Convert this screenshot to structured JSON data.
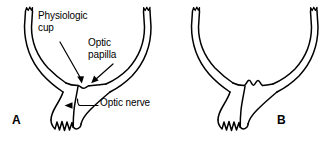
{
  "figure": {
    "background_color": "#ffffff",
    "stroke_color": "#000000",
    "width": 334,
    "height": 141
  },
  "labels": {
    "physiologic_cup": "Physiologic\ncup",
    "optic_papilla": "Optic\npapilla",
    "optic_nerve": "Optic nerve"
  },
  "panels": [
    {
      "letter": "A",
      "name": "normal-optic-disc",
      "description": "Normal eye wall with shallow physiologic cup"
    },
    {
      "letter": "B",
      "name": "excavated-optic-disc",
      "description": "Eye wall with deepened cup excavation"
    }
  ],
  "annotations": [
    {
      "name": "physiologic-cup-arrow",
      "points_to": "physiologic cup"
    },
    {
      "name": "optic-papilla-arrow",
      "points_to": "optic papilla"
    },
    {
      "name": "optic-nerve-arrow",
      "points_to": "optic nerve"
    }
  ]
}
